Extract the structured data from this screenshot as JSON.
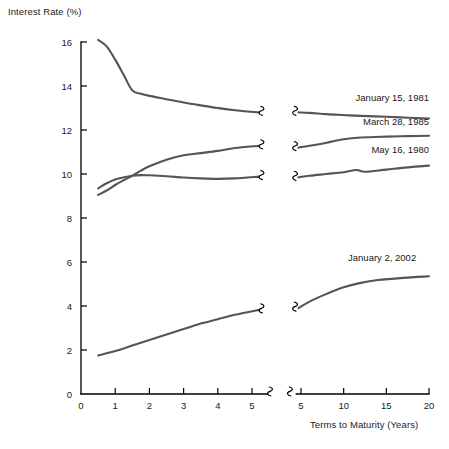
{
  "chart_data": {
    "type": "line",
    "title": "",
    "xlabel": "Terms to Maturity (Years)",
    "ylabel": "Interest Rate (%)",
    "ylim": [
      0,
      16
    ],
    "y_ticks": [
      0,
      2,
      4,
      6,
      8,
      10,
      12,
      14,
      16
    ],
    "grid": false,
    "legend_position": "inline-right-of-curve",
    "axis_break": true,
    "left_panel_xlim": [
      0,
      5.4
    ],
    "left_panel_x_ticks": [
      0,
      1,
      2,
      3,
      4,
      5
    ],
    "right_panel_xlim": [
      4.4,
      20
    ],
    "right_panel_x_ticks": [
      5,
      10,
      15,
      20
    ],
    "series": [
      {
        "name": "January 15, 1981",
        "color": "#555555",
        "left_points": [
          {
            "x": 0.5,
            "y": 16.1
          },
          {
            "x": 0.75,
            "y": 15.8
          },
          {
            "x": 1.0,
            "y": 15.2
          },
          {
            "x": 1.25,
            "y": 14.5
          },
          {
            "x": 1.5,
            "y": 13.8
          },
          {
            "x": 1.75,
            "y": 13.65
          },
          {
            "x": 2.0,
            "y": 13.55
          },
          {
            "x": 2.5,
            "y": 13.4
          },
          {
            "x": 3.0,
            "y": 13.25
          },
          {
            "x": 3.5,
            "y": 13.12
          },
          {
            "x": 4.0,
            "y": 13.0
          },
          {
            "x": 4.5,
            "y": 12.9
          },
          {
            "x": 5.2,
            "y": 12.8
          }
        ],
        "right_points": [
          {
            "x": 4.7,
            "y": 12.8
          },
          {
            "x": 6.0,
            "y": 12.78
          },
          {
            "x": 8.0,
            "y": 12.72
          },
          {
            "x": 10.0,
            "y": 12.68
          },
          {
            "x": 12.0,
            "y": 12.64
          },
          {
            "x": 15.0,
            "y": 12.6
          },
          {
            "x": 17.5,
            "y": 12.56
          },
          {
            "x": 20.0,
            "y": 12.52
          }
        ],
        "label_x": 20.0,
        "label_y": 13.3
      },
      {
        "name": "March 28, 1985",
        "color": "#555555",
        "left_points": [
          {
            "x": 0.5,
            "y": 9.05
          },
          {
            "x": 0.75,
            "y": 9.25
          },
          {
            "x": 1.0,
            "y": 9.5
          },
          {
            "x": 1.25,
            "y": 9.72
          },
          {
            "x": 1.5,
            "y": 9.92
          },
          {
            "x": 1.75,
            "y": 10.15
          },
          {
            "x": 2.0,
            "y": 10.35
          },
          {
            "x": 2.5,
            "y": 10.65
          },
          {
            "x": 3.0,
            "y": 10.85
          },
          {
            "x": 3.5,
            "y": 10.95
          },
          {
            "x": 4.0,
            "y": 11.05
          },
          {
            "x": 4.5,
            "y": 11.18
          },
          {
            "x": 5.2,
            "y": 11.28
          }
        ],
        "right_points": [
          {
            "x": 4.7,
            "y": 11.2
          },
          {
            "x": 6.0,
            "y": 11.28
          },
          {
            "x": 8.0,
            "y": 11.42
          },
          {
            "x": 10.0,
            "y": 11.58
          },
          {
            "x": 12.0,
            "y": 11.66
          },
          {
            "x": 15.0,
            "y": 11.7
          },
          {
            "x": 17.5,
            "y": 11.72
          },
          {
            "x": 20.0,
            "y": 11.74
          }
        ],
        "label_x": 20.0,
        "label_y": 12.25
      },
      {
        "name": "May 16, 1980",
        "color": "#555555",
        "left_points": [
          {
            "x": 0.5,
            "y": 9.35
          },
          {
            "x": 0.75,
            "y": 9.58
          },
          {
            "x": 1.0,
            "y": 9.75
          },
          {
            "x": 1.25,
            "y": 9.85
          },
          {
            "x": 1.5,
            "y": 9.92
          },
          {
            "x": 1.75,
            "y": 9.95
          },
          {
            "x": 2.0,
            "y": 9.94
          },
          {
            "x": 2.5,
            "y": 9.9
          },
          {
            "x": 3.0,
            "y": 9.84
          },
          {
            "x": 3.5,
            "y": 9.8
          },
          {
            "x": 4.0,
            "y": 9.78
          },
          {
            "x": 4.5,
            "y": 9.8
          },
          {
            "x": 5.2,
            "y": 9.88
          }
        ],
        "right_points": [
          {
            "x": 4.7,
            "y": 9.85
          },
          {
            "x": 6.0,
            "y": 9.92
          },
          {
            "x": 8.0,
            "y": 10.0
          },
          {
            "x": 10.0,
            "y": 10.08
          },
          {
            "x": 11.5,
            "y": 10.18
          },
          {
            "x": 12.5,
            "y": 10.1
          },
          {
            "x": 15.0,
            "y": 10.2
          },
          {
            "x": 17.5,
            "y": 10.3
          },
          {
            "x": 20.0,
            "y": 10.38
          }
        ],
        "label_x": 20.0,
        "label_y": 10.95
      },
      {
        "name": "January 2, 2002",
        "color": "#555555",
        "left_points": [
          {
            "x": 0.5,
            "y": 1.75
          },
          {
            "x": 1.0,
            "y": 1.95
          },
          {
            "x": 1.5,
            "y": 2.2
          },
          {
            "x": 2.0,
            "y": 2.45
          },
          {
            "x": 2.5,
            "y": 2.7
          },
          {
            "x": 3.0,
            "y": 2.95
          },
          {
            "x": 3.5,
            "y": 3.2
          },
          {
            "x": 4.0,
            "y": 3.4
          },
          {
            "x": 4.5,
            "y": 3.6
          },
          {
            "x": 5.2,
            "y": 3.82
          }
        ],
        "right_points": [
          {
            "x": 4.7,
            "y": 3.9
          },
          {
            "x": 6.0,
            "y": 4.2
          },
          {
            "x": 8.0,
            "y": 4.55
          },
          {
            "x": 10.0,
            "y": 4.85
          },
          {
            "x": 12.0,
            "y": 5.05
          },
          {
            "x": 14.0,
            "y": 5.18
          },
          {
            "x": 17.0,
            "y": 5.28
          },
          {
            "x": 20.0,
            "y": 5.35
          }
        ],
        "label_x": 18.5,
        "label_y": 6.05
      }
    ]
  },
  "axes": {
    "y_title": "Interest Rate (%)",
    "x_title": "Terms to Maturity (Years)",
    "y_tick_labels": [
      "0",
      "2",
      "4",
      "6",
      "8",
      "10",
      "12",
      "14",
      "16"
    ],
    "left_x_tick_labels": [
      "0",
      "1",
      "2",
      "3",
      "4",
      "5"
    ],
    "right_x_tick_labels": [
      "5",
      "10",
      "15",
      "20"
    ]
  }
}
